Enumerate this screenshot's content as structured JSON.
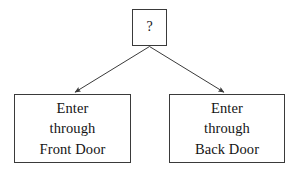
{
  "diagram": {
    "background_color": "#ffffff",
    "line_color": "#3a3a3a",
    "text_color": "#141414",
    "root": {
      "label": "?",
      "icon": "question-mark"
    },
    "branches": [
      {
        "id": "front-door",
        "lines": [
          "Enter",
          "through",
          "Front Door"
        ]
      },
      {
        "id": "back-door",
        "lines": [
          "Enter",
          "through",
          "Back Door"
        ]
      }
    ],
    "edges": [
      {
        "from": "root",
        "to": "front-door",
        "arrow": "down-left"
      },
      {
        "from": "root",
        "to": "back-door",
        "arrow": "down-right"
      }
    ]
  }
}
